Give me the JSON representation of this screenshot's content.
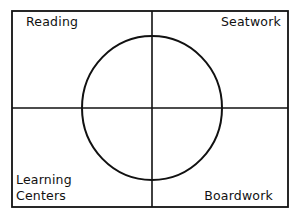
{
  "diagram": {
    "type": "quadrant-circle",
    "colors": {
      "line": "#111111",
      "background": "#ffffff"
    },
    "quadrants": {
      "top_left": "Reading",
      "top_right": "Seatwork",
      "bottom_left": [
        "Learning",
        "Centers"
      ],
      "bottom_right": "Boardwork"
    }
  }
}
